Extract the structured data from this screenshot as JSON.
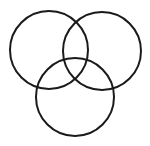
{
  "diagram": {
    "type": "venn",
    "sets": 3,
    "stroke_color": "#1a1a1a",
    "fill_color": "none",
    "background": "#ffffff",
    "circles": [
      {
        "name": "left",
        "cx": 49,
        "cy": 50,
        "r": 39
      },
      {
        "name": "right",
        "cx": 102,
        "cy": 51,
        "r": 39
      },
      {
        "name": "bottom",
        "cx": 75,
        "cy": 97,
        "r": 39
      }
    ]
  }
}
